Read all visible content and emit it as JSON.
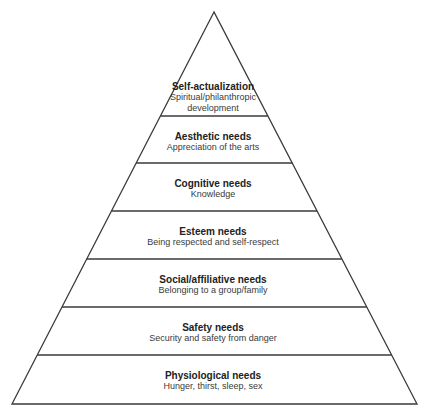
{
  "diagram": {
    "type": "pyramid",
    "colors": {
      "outline": "#3a3a3a",
      "fill": "#ffffff",
      "title": "#222222",
      "description": "#3a3a3a"
    },
    "tiers_top_to_bottom": [
      {
        "title": "Self-actualization",
        "description": [
          "Spiritual/philanthropic",
          "development"
        ]
      },
      {
        "title": "Aesthetic needs",
        "description": [
          "Appreciation of the arts"
        ]
      },
      {
        "title": "Cognitive needs",
        "description": [
          "Knowledge"
        ]
      },
      {
        "title": "Esteem needs",
        "description": [
          "Being respected and self-respect"
        ]
      },
      {
        "title": "Social/affiliative needs",
        "description": [
          "Belonging to a group/family"
        ]
      },
      {
        "title": "Safety needs",
        "description": [
          "Security and safety from danger"
        ]
      },
      {
        "title": "Physiological needs",
        "description": [
          "Hunger, thirst, sleep, sex"
        ]
      }
    ]
  }
}
